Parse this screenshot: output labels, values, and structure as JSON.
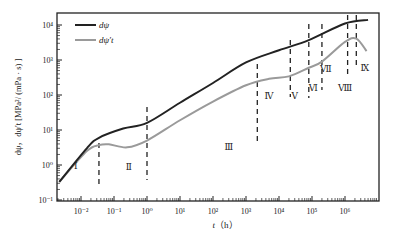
{
  "chart_data": {
    "type": "line",
    "title": "",
    "xlabel": "t (h)",
    "ylabel": "dψ, dψ′t  [MPa²/ (mPa·s)]",
    "xscale": "log",
    "yscale": "log",
    "xlim": [
      0.002,
      5000000
    ],
    "ylim": [
      0.1,
      15000
    ],
    "x_ticks": [
      "10⁻²",
      "10⁻¹",
      "10⁰",
      "10¹",
      "10²",
      "10³",
      "10⁴",
      "10⁵",
      "10⁶"
    ],
    "x_tick_values": [
      0.01,
      0.1,
      1,
      10,
      100,
      1000,
      10000,
      100000,
      1000000
    ],
    "y_ticks": [
      "10⁻¹",
      "10⁰",
      "10¹",
      "10²",
      "10³",
      "10⁴"
    ],
    "y_tick_values": [
      0.1,
      1,
      10,
      100,
      1000,
      10000
    ],
    "grid": false,
    "legend_position": "upper left",
    "series": [
      {
        "name": "dψ",
        "color": "#222222",
        "x": [
          0.0022,
          0.015,
          0.035,
          0.19,
          1,
          10,
          100,
          1000,
          10000,
          80000,
          1000000,
          5000000
        ],
        "values": [
          0.33,
          3.0,
          6.0,
          11,
          16,
          60,
          220,
          850,
          1900,
          3700,
          11000,
          14000
        ]
      },
      {
        "name": "dψ′t",
        "color": "#9a9a9a",
        "x": [
          0.0022,
          0.015,
          0.035,
          0.07,
          0.25,
          1,
          10,
          100,
          1000,
          5000,
          20000,
          80000,
          200000,
          1000000,
          2200000,
          4500000
        ],
        "values": [
          0.33,
          2.5,
          3.7,
          3.9,
          3.2,
          5.0,
          19,
          65,
          190,
          290,
          340,
          600,
          900,
          3300,
          4100,
          1800
        ]
      }
    ],
    "regions": [
      {
        "label": "Ⅰ",
        "x": 0.007,
        "y": 0.75
      },
      {
        "label": "Ⅱ",
        "x": 0.28,
        "y": 0.7
      },
      {
        "label": "Ⅲ",
        "x": 300,
        "y": 2.6
      },
      {
        "label": "Ⅳ",
        "x": 5000,
        "y": 75
      },
      {
        "label": "Ⅴ",
        "x": 30000,
        "y": 75
      },
      {
        "label": "Ⅵ",
        "x": 110000,
        "y": 130
      },
      {
        "label": "Ⅶ",
        "x": 260000,
        "y": 450
      },
      {
        "label": "Ⅷ",
        "x": 1000000,
        "y": 130
      },
      {
        "label": "Ⅸ",
        "x": 4000000,
        "y": 500
      }
    ],
    "dividers_x": [
      0.035,
      1,
      2200,
      22000,
      80000,
      200000,
      1200000,
      2200000
    ],
    "annotations": [
      "Ⅰ",
      "Ⅱ",
      "Ⅲ",
      "Ⅳ",
      "Ⅴ",
      "Ⅵ",
      "Ⅶ",
      "Ⅷ",
      "Ⅸ"
    ]
  },
  "legend": {
    "items": [
      {
        "label": "dψ",
        "color": "#222222"
      },
      {
        "label": "dψ′t",
        "color": "#9a9a9a"
      }
    ]
  },
  "axes": {
    "xlabel_italic": "t",
    "xlabel_unit": "（h）",
    "ylabel": "dψ，dψ′t  [MPa²/ (mPa · s) ]"
  }
}
